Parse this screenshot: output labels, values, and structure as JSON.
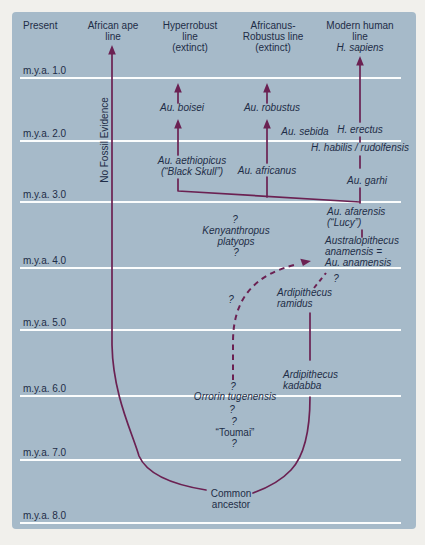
{
  "colors": {
    "outer_background": "#f1f0ec",
    "panel_background": "#a6bac9",
    "branch_line": "#6b2152",
    "text": "#1e2d47",
    "grid_line": "#fbfdfd"
  },
  "timeline": [
    {
      "label": "m.y.a. 1.0",
      "y": 78
    },
    {
      "label": "m.y.a. 2.0",
      "y": 141
    },
    {
      "label": "m.y.a. 3.0",
      "y": 202
    },
    {
      "label": "m.y.a. 4.0",
      "y": 268
    },
    {
      "label": "m.y.a. 5.0",
      "y": 330
    },
    {
      "label": "m.y.a. 6.0",
      "y": 396
    },
    {
      "label": "m.y.a. 7.0",
      "y": 460
    },
    {
      "label": "m.y.a. 8.0",
      "y": 523
    }
  ],
  "labels": [
    {
      "name": "header-present",
      "lines": [
        "Present"
      ],
      "x": 23,
      "y": 20,
      "align": "left",
      "italic": false
    },
    {
      "name": "header-african-ape-line",
      "lines": [
        "African ape",
        "line"
      ],
      "x": 113,
      "y": 20,
      "align": "center",
      "italic": false
    },
    {
      "name": "header-hyperrobust-line",
      "lines": [
        "Hyperrobust",
        "line",
        "(extinct)"
      ],
      "x": 190,
      "y": 20,
      "align": "center",
      "italic": false
    },
    {
      "name": "header-africanus-robustus-line",
      "lines": [
        "Africanus-",
        "Robustus line",
        "(extinct)"
      ],
      "x": 273,
      "y": 20,
      "align": "center",
      "italic": false
    },
    {
      "name": "header-modern-human-line",
      "lines": [
        "Modern human",
        "line"
      ],
      "x": 360,
      "y": 20,
      "align": "center",
      "italic": false
    },
    {
      "name": "header-h-sapiens",
      "lines": [
        "H. sapiens"
      ],
      "x": 360,
      "y": 42,
      "align": "center",
      "italic": true
    },
    {
      "name": "no-fossil-evidence-label",
      "lines": [
        "No Fossil Evidence"
      ],
      "x": 104,
      "y": 140,
      "align": "left",
      "italic": false,
      "rotate": true
    },
    {
      "name": "au-boisei-label",
      "lines": [
        "Au. boisei"
      ],
      "x": 182,
      "y": 102,
      "align": "center",
      "italic": true
    },
    {
      "name": "au-robustus-label",
      "lines": [
        "Au. robustus"
      ],
      "x": 272,
      "y": 102,
      "align": "center",
      "italic": true
    },
    {
      "name": "au-sebida-label",
      "lines": [
        "Au. sebida"
      ],
      "x": 305,
      "y": 126,
      "align": "center",
      "italic": true
    },
    {
      "name": "h-erectus-label",
      "lines": [
        "H. erectus"
      ],
      "x": 360,
      "y": 124,
      "align": "center",
      "italic": true
    },
    {
      "name": "h-habilis-rudolfensis-label",
      "lines": [
        "H. habilis / rudolfensis"
      ],
      "x": 360,
      "y": 142,
      "align": "center",
      "italic": true
    },
    {
      "name": "au-aethiopicus-label",
      "lines": [
        "Au. aethiopicus",
        "(“Black Skull”)"
      ],
      "x": 192,
      "y": 155,
      "align": "center",
      "italic": true
    },
    {
      "name": "au-africanus-label",
      "lines": [
        "Au. africanus"
      ],
      "x": 267,
      "y": 165,
      "align": "center",
      "italic": true
    },
    {
      "name": "au-garhi-label",
      "lines": [
        "Au. garhi"
      ],
      "x": 367,
      "y": 175,
      "align": "center",
      "italic": true
    },
    {
      "name": "au-afarensis-lucy-label",
      "lines": [
        "Au. afarensis",
        "(“Lucy”)"
      ],
      "x": 327,
      "y": 206,
      "align": "left",
      "italic": true
    },
    {
      "name": "australopithecus-anamensis-label",
      "lines": [
        "Australopithecus",
        "anamensis =",
        "Au. anamensis"
      ],
      "x": 325,
      "y": 235,
      "align": "left",
      "italic": true
    },
    {
      "name": "question-kenyanthropus-top",
      "lines": [
        "?"
      ],
      "x": 235,
      "y": 214,
      "align": "center",
      "italic": true
    },
    {
      "name": "kenyanthropus-platyops-label",
      "lines": [
        "Kenyanthropus",
        "platyops"
      ],
      "x": 236,
      "y": 225,
      "align": "center",
      "italic": true
    },
    {
      "name": "question-kenyanthropus-bottom",
      "lines": [
        "?"
      ],
      "x": 236,
      "y": 247,
      "align": "center",
      "italic": true
    },
    {
      "name": "question-dashed-curve",
      "lines": [
        "?"
      ],
      "x": 231,
      "y": 294,
      "align": "center",
      "italic": true
    },
    {
      "name": "ardipithecus-ramidus-label",
      "lines": [
        "Ardipithecus",
        "ramidus"
      ],
      "x": 277,
      "y": 287,
      "align": "left",
      "italic": true
    },
    {
      "name": "question-ramidus-link",
      "lines": [
        "?"
      ],
      "x": 336,
      "y": 273,
      "align": "center",
      "italic": true
    },
    {
      "name": "ardipithecus-kadabba-label",
      "lines": [
        "Ardipithecus",
        "kadabba"
      ],
      "x": 283,
      "y": 369,
      "align": "left",
      "italic": true
    },
    {
      "name": "question-orrorin-top",
      "lines": [
        "?"
      ],
      "x": 233,
      "y": 381,
      "align": "center",
      "italic": true
    },
    {
      "name": "orrorin-tugenensis-label",
      "lines": [
        "Orrorin tugenensis"
      ],
      "x": 235,
      "y": 391,
      "align": "center",
      "italic": true
    },
    {
      "name": "question-orrorin-bottom",
      "lines": [
        "?"
      ],
      "x": 232,
      "y": 404,
      "align": "center",
      "italic": true
    },
    {
      "name": "question-toumai-top",
      "lines": [
        "?"
      ],
      "x": 234,
      "y": 416,
      "align": "center",
      "italic": true
    },
    {
      "name": "toumai-label",
      "lines": [
        "“Toumai”"
      ],
      "x": 235,
      "y": 427,
      "align": "center",
      "italic": false
    },
    {
      "name": "question-toumai-bottom",
      "lines": [
        "?"
      ],
      "x": 234,
      "y": 438,
      "align": "center",
      "italic": true
    },
    {
      "name": "common-ancestor-label",
      "lines": [
        "Common",
        "ancestor"
      ],
      "x": 231,
      "y": 488,
      "align": "center",
      "italic": false
    }
  ]
}
